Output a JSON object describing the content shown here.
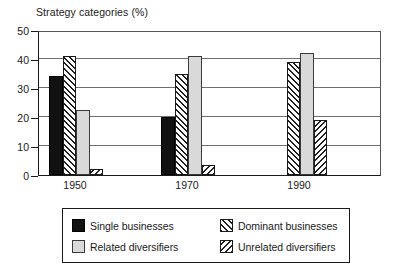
{
  "chart_data": {
    "type": "bar",
    "title": "Strategy categories (%)",
    "xlabel": "",
    "ylabel": "",
    "ylim": [
      0,
      50
    ],
    "ytick_labels": [
      "0",
      "10",
      "20",
      "30",
      "40",
      "50"
    ],
    "ytick_values": [
      0,
      10,
      20,
      30,
      40,
      50
    ],
    "grid": true,
    "gridline_values": [
      10,
      20,
      30,
      40
    ],
    "categories": [
      "1950",
      "1970",
      "1990"
    ],
    "legend_position": "below-plot",
    "series": [
      {
        "name": "Single businesses",
        "pattern": "solid-black",
        "color": "#111111",
        "values": [
          34,
          20,
          0
        ]
      },
      {
        "name": "Dominant businesses",
        "pattern": "forward-hatch",
        "color": "#1f1f1f",
        "values": [
          41,
          35,
          39
        ]
      },
      {
        "name": "Related diversifiers",
        "pattern": "light-gray",
        "color": "#d9d9d9",
        "values": [
          22.5,
          41,
          42
        ]
      },
      {
        "name": "Unrelated diversifiers",
        "pattern": "back-hatch",
        "color": "#1f1f1f",
        "values": [
          2,
          3.5,
          19
        ]
      }
    ]
  },
  "legend": {
    "entries": [
      {
        "label": "Single businesses",
        "swatch": "solid-black-swatch"
      },
      {
        "label": "Dominant businesses",
        "swatch": "forward-hatch-swatch"
      },
      {
        "label": "Related diversifiers",
        "swatch": "light-gray-swatch"
      },
      {
        "label": "Unrelated diversifiers",
        "swatch": "back-hatch-swatch"
      }
    ]
  }
}
